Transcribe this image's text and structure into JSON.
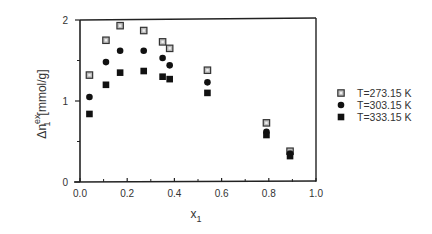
{
  "chart_data": {
    "type": "scatter",
    "title": "",
    "xlabel": "x1",
    "ylabel": "Δn1ex [mmol/g]",
    "xlim": [
      0.0,
      1.0
    ],
    "ylim": [
      0,
      2
    ],
    "xticks": [
      "0.0",
      "0.2",
      "0.4",
      "0.6",
      "0.8",
      "1.0"
    ],
    "yticks": [
      "0",
      "1",
      "2"
    ],
    "grid": false,
    "legend_position": "right",
    "series": [
      {
        "name": "T=273.15 K",
        "marker": "open-square",
        "x": [
          0.04,
          0.11,
          0.17,
          0.27,
          0.35,
          0.38,
          0.54,
          0.79,
          0.89
        ],
        "y": [
          1.32,
          1.75,
          1.93,
          1.87,
          1.73,
          1.65,
          1.38,
          0.73,
          0.38
        ]
      },
      {
        "name": "T=303.15 K",
        "marker": "filled-diamond",
        "x": [
          0.04,
          0.11,
          0.17,
          0.27,
          0.35,
          0.38,
          0.54,
          0.79,
          0.89
        ],
        "y": [
          1.05,
          1.48,
          1.62,
          1.62,
          1.53,
          1.44,
          1.23,
          0.62,
          0.35
        ]
      },
      {
        "name": "T=333.15 K",
        "marker": "filled-square",
        "x": [
          0.04,
          0.11,
          0.17,
          0.27,
          0.35,
          0.38,
          0.54,
          0.79,
          0.89
        ],
        "y": [
          0.84,
          1.2,
          1.35,
          1.37,
          1.3,
          1.27,
          1.1,
          0.58,
          0.32
        ]
      }
    ]
  },
  "labels": {
    "xlabel_main": "x",
    "xlabel_sub": "1",
    "ylabel_main": "Δn",
    "ylabel_sup": "ex",
    "ylabel_sub": "1",
    "ylabel_unit": "[mmol/g]"
  },
  "legend": [
    {
      "label": "T=273.15 K",
      "marker": "open-square"
    },
    {
      "label": "T=303.15 K",
      "marker": "filled-diamond"
    },
    {
      "label": "T=333.15 K",
      "marker": "filled-square"
    }
  ]
}
